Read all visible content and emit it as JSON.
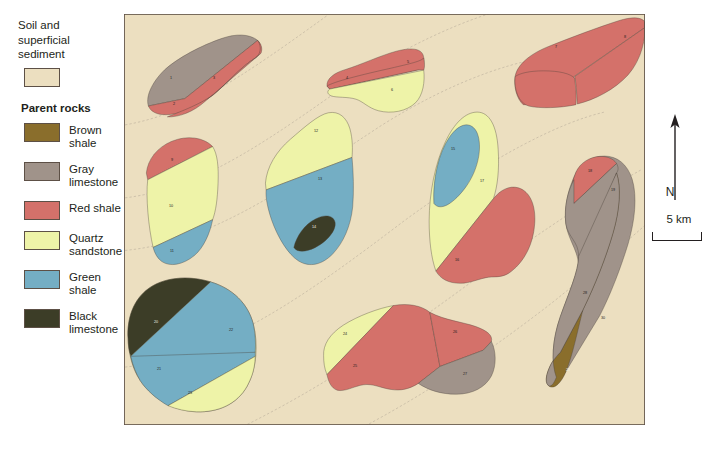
{
  "legend": {
    "soil_title": "Soil and\nsuperficial\nsediment",
    "soil_color": "#ecdfc0",
    "parent_rocks_heading": "Parent rocks",
    "items": [
      {
        "label": "Brown shale",
        "color": "#8a6e2c"
      },
      {
        "label": "Gray\nlimestone",
        "color": "#a0938a"
      },
      {
        "label": "Red shale",
        "color": "#d4716a"
      },
      {
        "label": "Quartz\nsandstone",
        "color": "#eef3a8"
      },
      {
        "label": "Green shale",
        "color": "#74aec4"
      },
      {
        "label": "Black\nlimestone",
        "color": "#3c3d27"
      }
    ]
  },
  "map": {
    "background_color": "#ecdfc0",
    "frame_color": "#5d5046",
    "contour_color": "#9b8f86",
    "units": [
      {
        "id": "1",
        "rock": "Gray limestone",
        "color": "#a0938a",
        "x": 47,
        "y": 190,
        "dark": false
      },
      {
        "id": "2",
        "rock": "Red shale",
        "color": "#d4716a",
        "x": 50,
        "y": 265,
        "dark": false
      },
      {
        "id": "3",
        "rock": "Red shale",
        "color": "#d4716a",
        "x": 90,
        "y": 188,
        "dark": false
      },
      {
        "id": "4",
        "rock": "Red shale",
        "color": "#d4716a",
        "x": 223,
        "y": 188,
        "dark": false
      },
      {
        "id": "5",
        "rock": "Red shale",
        "color": "#d4716a",
        "x": 284,
        "y": 143,
        "dark": false
      },
      {
        "id": "6",
        "rock": "Quartz sandstone",
        "color": "#eef3a8",
        "x": 268,
        "y": 224,
        "dark": false
      },
      {
        "id": "7",
        "rock": "Red shale",
        "color": "#d4716a",
        "x": 432,
        "y": 99,
        "dark": false
      },
      {
        "id": "8",
        "rock": "Red shale",
        "color": "#d4716a",
        "x": 501,
        "y": 67,
        "dark": false
      },
      {
        "id": "9",
        "rock": "Red shale",
        "color": "#d4716a",
        "x": 48,
        "y": 431,
        "dark": false
      },
      {
        "id": "10",
        "rock": "Quartz sandstone",
        "color": "#eef3a8",
        "x": 47,
        "y": 568,
        "dark": false
      },
      {
        "id": "11",
        "rock": "Green shale",
        "color": "#74aec4",
        "x": 48,
        "y": 700,
        "dark": false
      },
      {
        "id": "12",
        "rock": "Quartz sandstone",
        "color": "#eef3a8",
        "x": 192,
        "y": 346,
        "dark": false
      },
      {
        "id": "13",
        "rock": "Green shale",
        "color": "#74aec4",
        "x": 196,
        "y": 487,
        "dark": false
      },
      {
        "id": "14",
        "rock": "Black limestone",
        "color": "#3c3d27",
        "x": 190,
        "y": 630,
        "dark": true
      },
      {
        "id": "15",
        "rock": "Green shale",
        "color": "#74aec4",
        "x": 329,
        "y": 400,
        "dark": false
      },
      {
        "id": "16",
        "rock": "Red shale",
        "color": "#d4716a",
        "x": 333,
        "y": 726,
        "dark": false
      },
      {
        "id": "17",
        "rock": "Quartz sandstone",
        "color": "#eef3a8",
        "x": 358,
        "y": 493,
        "dark": false
      },
      {
        "id": "18",
        "rock": "Red shale",
        "color": "#d4716a",
        "x": 466,
        "y": 463,
        "dark": false
      },
      {
        "id": "19",
        "rock": "Gray limestone",
        "color": "#a0938a",
        "x": 489,
        "y": 521,
        "dark": false
      },
      {
        "id": "20",
        "rock": "Black limestone",
        "color": "#3c3d27",
        "x": 32,
        "y": 911,
        "dark": true
      },
      {
        "id": "21",
        "rock": "Green shale",
        "color": "#74aec4",
        "x": 35,
        "y": 1049,
        "dark": false
      },
      {
        "id": "22",
        "rock": "Green shale",
        "color": "#74aec4",
        "x": 107,
        "y": 933,
        "dark": false
      },
      {
        "id": "23",
        "rock": "Quartz sandstone",
        "color": "#eef3a8",
        "x": 66,
        "y": 1121,
        "dark": false
      },
      {
        "id": "24",
        "rock": "Quartz sandstone",
        "color": "#eef3a8",
        "x": 221,
        "y": 945,
        "dark": false
      },
      {
        "id": "25",
        "rock": "Red shale",
        "color": "#d4716a",
        "x": 231,
        "y": 1040,
        "dark": false
      },
      {
        "id": "26",
        "rock": "Red shale",
        "color": "#d4716a",
        "x": 331,
        "y": 941,
        "dark": false
      },
      {
        "id": "27",
        "rock": "Gray limestone",
        "color": "#a0938a",
        "x": 341,
        "y": 1065,
        "dark": false
      },
      {
        "id": "28",
        "rock": "Gray limestone",
        "color": "#a0938a",
        "x": 461,
        "y": 825,
        "dark": false
      },
      {
        "id": "29",
        "rock": "Brown shale",
        "color": "#8a6e2c",
        "x": 444,
        "y": 1052,
        "dark": true
      },
      {
        "id": "30",
        "rock": "Brown shale",
        "color": "#8a6e2c",
        "x": 479,
        "y": 899,
        "dark": false
      }
    ]
  },
  "annotations": {
    "north_label": "N",
    "scale_label": "5 km"
  }
}
